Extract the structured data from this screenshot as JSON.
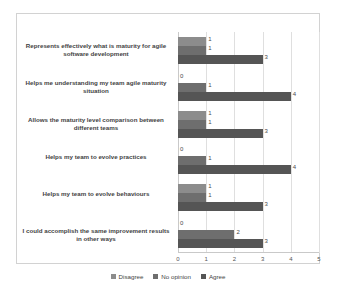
{
  "chart_data": {
    "type": "bar",
    "orientation": "horizontal",
    "title": "",
    "xlabel": "",
    "ylabel": "",
    "xlim": [
      0,
      5
    ],
    "xticks": [
      "0",
      "1",
      "2",
      "3",
      "4",
      "5"
    ],
    "grid": true,
    "legend_position": "bottom",
    "categories": [
      "Represents effectively what is maturity for agile software development",
      "Helps me understanding my team agile maturity situation",
      "Allows the maturity level comparison between different teams",
      "Helps my team to evolve practices",
      "Helps my team to evolve behaviours",
      "I could accomplish the same improvement results in other ways"
    ],
    "series": [
      {
        "name": "Disagree",
        "color": "#8c8c8c",
        "values": [
          1,
          0,
          1,
          0,
          1,
          0
        ]
      },
      {
        "name": "No opinion",
        "color": "#6e6e6e",
        "values": [
          1,
          1,
          1,
          1,
          1,
          2
        ]
      },
      {
        "name": "Agree",
        "color": "#555555",
        "values": [
          3,
          4,
          3,
          4,
          3,
          3
        ]
      }
    ]
  },
  "legend": {
    "items": [
      {
        "label": "Disagree"
      },
      {
        "label": "No opinion"
      },
      {
        "label": "Agree"
      }
    ]
  }
}
